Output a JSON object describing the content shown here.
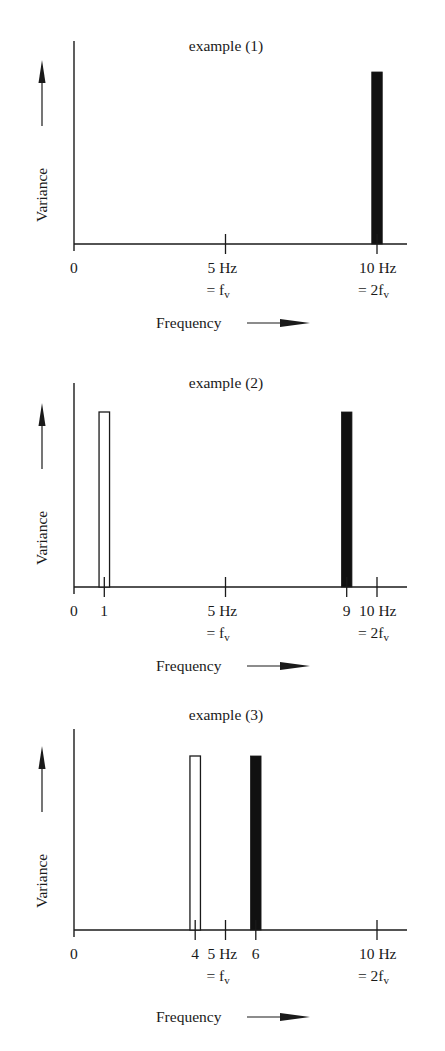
{
  "chart_data": [
    {
      "type": "bar",
      "title": "example (1)",
      "xlabel": "Frequency",
      "ylabel": "Variance",
      "xlim": [
        0,
        11
      ],
      "ticks": [
        {
          "value": 5,
          "label": "5 Hz",
          "sublabel": "= f",
          "sub": "v"
        },
        {
          "value": 10,
          "label": "10 Hz",
          "sublabel": "= 2f",
          "sub": "v"
        }
      ],
      "origin_label": "0",
      "bars": [
        {
          "x": 10,
          "fill": "black",
          "height": 0.85
        }
      ]
    },
    {
      "type": "bar",
      "title": "example (2)",
      "xlabel": "Frequency",
      "ylabel": "Variance",
      "xlim": [
        0,
        11
      ],
      "ticks": [
        {
          "value": 1,
          "label": "1"
        },
        {
          "value": 5,
          "label": "5 Hz",
          "sublabel": "= f",
          "sub": "v"
        },
        {
          "value": 9,
          "label": "9"
        },
        {
          "value": 10,
          "label": "10 Hz",
          "sublabel": "= 2f",
          "sub": "v"
        }
      ],
      "origin_label": "0",
      "bars": [
        {
          "x": 1,
          "fill": "white",
          "height": 0.86
        },
        {
          "x": 9,
          "fill": "black",
          "height": 0.85
        }
      ]
    },
    {
      "type": "bar",
      "title": "example (3)",
      "xlabel": "Frequency",
      "ylabel": "Variance",
      "xlim": [
        0,
        11
      ],
      "ticks": [
        {
          "value": 4,
          "label": "4"
        },
        {
          "value": 5,
          "label": "5 Hz",
          "sublabel": "= f",
          "sub": "v"
        },
        {
          "value": 6,
          "label": "6"
        },
        {
          "value": 10,
          "label": "10 Hz",
          "sublabel": "= 2f",
          "sub": "v"
        }
      ],
      "origin_label": "0",
      "bars": [
        {
          "x": 4,
          "fill": "white",
          "height": 0.87
        },
        {
          "x": 6,
          "fill": "black",
          "height": 0.87
        }
      ]
    }
  ],
  "panels": [
    {
      "title": "example (1)",
      "ylabel": "Variance",
      "xlabel": "Frequency"
    },
    {
      "title": "example (2)",
      "ylabel": "Variance",
      "xlabel": "Frequency"
    },
    {
      "title": "example (3)",
      "ylabel": "Variance",
      "xlabel": "Frequency"
    }
  ],
  "colors": {
    "ink": "#1a1a1a",
    "bar_filled": "#111111",
    "bar_open": "#ffffff",
    "background": "#ffffff"
  }
}
